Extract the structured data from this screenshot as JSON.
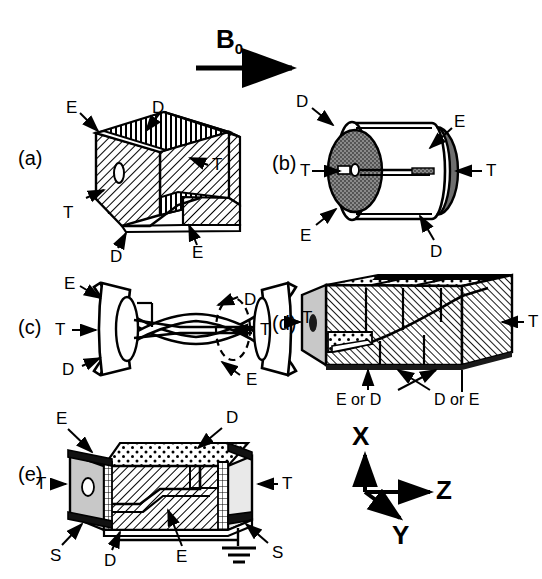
{
  "figure": {
    "field_label": "B",
    "field_subscript": "0",
    "panels": [
      {
        "id": "(a)",
        "shape": "open rectangular box",
        "labels": [
          "E",
          "D",
          "T",
          "T",
          "D",
          "E"
        ]
      },
      {
        "id": "(b)",
        "shape": "cylinder",
        "labels": [
          "D",
          "E",
          "T",
          "T",
          "E",
          "D"
        ]
      },
      {
        "id": "(c)",
        "shape": "hyperboloid hourglass",
        "labels": [
          "E",
          "D",
          "T",
          "T",
          "D",
          "E"
        ]
      },
      {
        "id": "(d)",
        "shape": "segmented rectangular bar",
        "labels": [
          "T",
          "T"
        ],
        "electrode_pairs": [
          "E or D",
          "D or E"
        ]
      },
      {
        "id": "(e)",
        "shape": "shielded rectangular box",
        "labels": [
          "E",
          "D",
          "T",
          "T",
          "S",
          "S",
          "D",
          "E"
        ]
      }
    ],
    "axes": {
      "x": "X",
      "y": "Y",
      "z": "Z"
    },
    "terminals": {
      "E": "E",
      "D": "D",
      "T": "T",
      "S": "S"
    },
    "colors": {
      "stroke": "#000000",
      "fill_white": "#ffffff",
      "fill_gray_light": "#c8c8c8",
      "fill_gray_dark": "#6e6e6e",
      "background": "#ffffff"
    }
  }
}
